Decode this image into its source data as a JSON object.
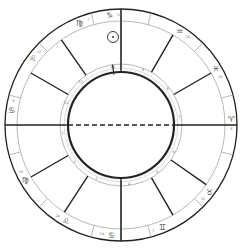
{
  "chart": {
    "type": "natal-wheel",
    "center": [
      121,
      125
    ],
    "radii": {
      "outer": 116,
      "zodiac_inner": 104,
      "house_ring_outer": 61,
      "inner": 53
    },
    "colors": {
      "line": "#222222",
      "thin": "#999999",
      "glyph": "#555555",
      "bg": "#ffffff"
    },
    "angles": {
      "asc_label": "ASC",
      "mc_label": "MC"
    },
    "house_cusps_deg": [
      180,
      210,
      237,
      270,
      300,
      325,
      0,
      30,
      60,
      90,
      125,
      150
    ],
    "sign_boundaries_deg": [
      195,
      225,
      255,
      285,
      315,
      345,
      15,
      45,
      75,
      105,
      135,
      165
    ],
    "signs": [
      {
        "glyph": "♋",
        "deg": "8",
        "angle": 172
      },
      {
        "glyph": "♌",
        "deg": "12",
        "angle": 143
      },
      {
        "glyph": "♍",
        "deg": "7",
        "angle": 112
      },
      {
        "glyph": "♑",
        "deg": "19",
        "angle": 96
      },
      {
        "glyph": "♒",
        "deg": "24",
        "angle": 58
      },
      {
        "glyph": "♓",
        "deg": "26",
        "angle": 31
      },
      {
        "glyph": "♈",
        "deg": "8",
        "angle": 3
      },
      {
        "glyph": "♉",
        "deg": "12",
        "angle": -37
      },
      {
        "glyph": "♊",
        "deg": "7",
        "angle": -68
      },
      {
        "glyph": "♋",
        "deg": "19",
        "angle": -95
      },
      {
        "glyph": "♌",
        "deg": "24",
        "angle": -120
      },
      {
        "glyph": "♍",
        "deg": "26",
        "angle": -150
      }
    ],
    "house_numbers": [
      "1",
      "2",
      "3",
      "4",
      "5",
      "6",
      "7",
      "8",
      "9",
      "10",
      "11",
      "12"
    ],
    "planets": [
      {
        "name": "sun",
        "glyph": "☉",
        "x": 113,
        "y": 37
      }
    ]
  }
}
